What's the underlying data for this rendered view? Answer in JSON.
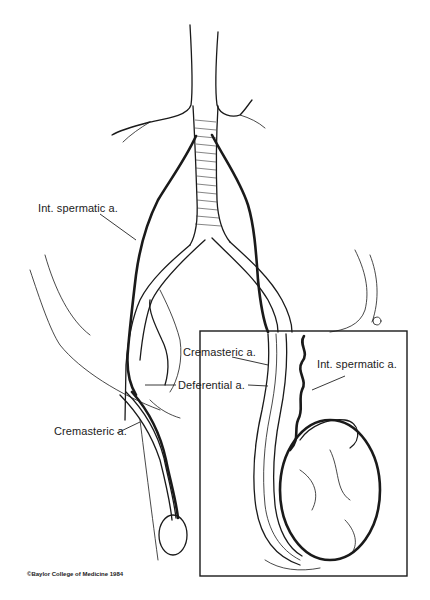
{
  "figure": {
    "labels": {
      "int_spermatic_main": "Int. spermatic a.",
      "deferential": "Deferential a.",
      "cremasteric_main": "Cremasteric a.",
      "cremasteric_inset": "Cremasteric a.",
      "int_spermatic_inset": "Int. spermatic a."
    },
    "credit": "©Baylor College of Medicine 1984",
    "inset": {
      "x": 200,
      "y": 331,
      "width": 207,
      "height": 245
    },
    "colors": {
      "ink": "#1a1a1a",
      "background": "#ffffff"
    }
  }
}
